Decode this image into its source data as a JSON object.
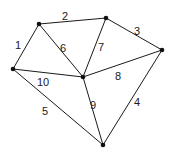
{
  "diagram": {
    "type": "graph",
    "directed": false,
    "colors": {
      "edge": "#1a1a1a",
      "node": "#111111",
      "background": "#ffffff"
    },
    "nodes": [
      {
        "id": "A",
        "x": 39,
        "y": 24
      },
      {
        "id": "B",
        "x": 106,
        "y": 18
      },
      {
        "id": "C",
        "x": 162,
        "y": 50
      },
      {
        "id": "D",
        "x": 13,
        "y": 69
      },
      {
        "id": "E",
        "x": 83,
        "y": 77
      },
      {
        "id": "F",
        "x": 103,
        "y": 145
      }
    ],
    "edges": [
      {
        "label": "1",
        "from": "D",
        "to": "A",
        "lx": 18,
        "ly": 46
      },
      {
        "label": "2",
        "from": "A",
        "to": "B",
        "lx": 65,
        "ly": 17
      },
      {
        "label": "3",
        "from": "B",
        "to": "C",
        "lx": 137,
        "ly": 32
      },
      {
        "label": "4",
        "from": "C",
        "to": "F",
        "lx": 137,
        "ly": 103
      },
      {
        "label": "5",
        "from": "D",
        "to": "F",
        "lx": 45,
        "ly": 112
      },
      {
        "label": "6",
        "from": "A",
        "to": "E",
        "lx": 63,
        "ly": 49
      },
      {
        "label": "7",
        "from": "B",
        "to": "E",
        "lx": 101,
        "ly": 48
      },
      {
        "label": "8",
        "from": "E",
        "to": "C",
        "lx": 118,
        "ly": 77
      },
      {
        "label": "9",
        "from": "E",
        "to": "F",
        "lx": 93,
        "ly": 106
      },
      {
        "label": "10",
        "from": "D",
        "to": "E",
        "lx": 43,
        "ly": 83
      }
    ]
  }
}
